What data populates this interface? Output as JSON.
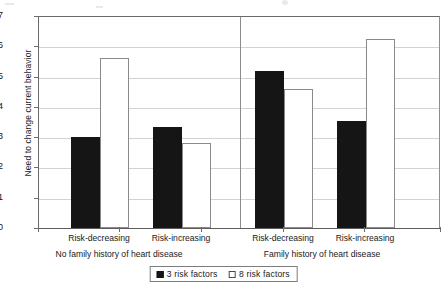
{
  "chart_data": {
    "type": "bar",
    "title": "",
    "xlabel": "",
    "ylabel": "Need to change current behavior",
    "ylim": [
      0,
      7
    ],
    "ytick_labels": [
      "0",
      "1",
      "2",
      "3",
      "4",
      "5",
      "6",
      "7"
    ],
    "grid": true,
    "legend_position": "bottom-center",
    "categories": [
      "Risk-decreasing",
      "Risk-increasing",
      "Risk-decreasing",
      "Risk-increasing"
    ],
    "panels": [
      {
        "label": "No family history of heart disease",
        "categories": [
          "Risk-decreasing",
          "Risk-increasing"
        ]
      },
      {
        "label": "Family history of heart disease",
        "categories": [
          "Risk-decreasing",
          "Risk-increasing"
        ]
      }
    ],
    "series": [
      {
        "name": "3 risk factors",
        "style": "filled",
        "color": "#151515",
        "values": [
          3.0,
          3.35,
          5.2,
          3.55
        ]
      },
      {
        "name": "8 risk factors",
        "style": "hollow",
        "color": "#ffffff",
        "values": [
          5.6,
          2.82,
          4.6,
          6.25
        ]
      }
    ]
  },
  "axis": {
    "ticks": [
      {
        "value": 7,
        "label": "7"
      },
      {
        "value": 6,
        "label": "6"
      },
      {
        "value": 5,
        "label": "5"
      },
      {
        "value": 4,
        "label": "4"
      },
      {
        "value": 3,
        "label": "3"
      },
      {
        "value": 2,
        "label": "2"
      },
      {
        "value": 1,
        "label": "1"
      },
      {
        "value": 0,
        "label": "0"
      }
    ]
  },
  "legend": {
    "items": [
      {
        "label": "3 risk factors",
        "style": "filled"
      },
      {
        "label": "8 risk factors",
        "style": "hollow"
      }
    ]
  }
}
